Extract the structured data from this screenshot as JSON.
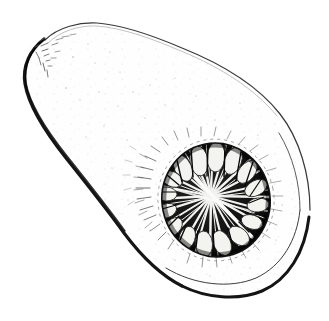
{
  "image": {
    "subject": "butternut-squash-half",
    "description": "Pen-and-ink line drawing of a butternut squash halved lengthwise, showing the pear-shaped body with narrow neck at upper left and bulbous seed cavity at lower right",
    "style": "engraving / hatched line art",
    "width": 329,
    "height": 321,
    "alt_text": "Butternut squash cut lengthwise showing seed cavity"
  },
  "colors": {
    "background": "#ffffff",
    "ink": "#1a1a1a",
    "ink_soft": "#4a4a4a",
    "ink_faint": "#9a9a9a",
    "flesh": "#fdfdfd",
    "cavity_dark": "#111111",
    "seed_light": "#f4f4f2"
  },
  "parts": [
    {
      "id": "neck",
      "label": "Neck",
      "note": "Narrow cylindrical upper-left portion with rounded tip"
    },
    {
      "id": "bulb",
      "label": "Bulb",
      "note": "Rounded lower-right portion containing the seed cavity"
    },
    {
      "id": "rind",
      "label": "Rind",
      "note": "Double outline along the lower and right edge"
    },
    {
      "id": "flesh",
      "label": "Flesh",
      "note": "Pale interior surface with sparse stipple texture"
    },
    {
      "id": "seed-cavity",
      "label": "Seed cavity",
      "note": "Dark circular hollow with radiating fibres"
    },
    {
      "id": "seeds",
      "label": "Seeds",
      "note": "Pale oval seeds ringing the cavity perimeter"
    },
    {
      "id": "fibres",
      "label": "Fibres",
      "note": "White strands radiating from cavity centre"
    }
  ],
  "geometry": {
    "cavity": {
      "center_x": 216,
      "center_y": 200,
      "radius_x": 54,
      "radius_y": 57,
      "rotation_deg": -12
    },
    "fibre_count": 34,
    "seed_count": 16,
    "outline_points": "M 93,22 C 62,22 36,34 26,50 C 14,69 20,92 34,112 C 52,138 78,165 102,198 C 122,226 140,258 170,280 C 198,300 238,303 266,288 C 292,274 308,246 310,213 C 312,176 300,140 280,113 C 258,83 222,61 184,47 C 154,35 120,22 93,22 Z"
  }
}
